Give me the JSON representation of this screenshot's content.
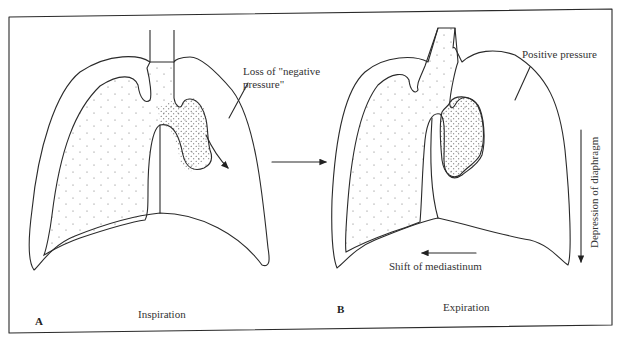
{
  "figure": {
    "panels": [
      {
        "letter": "A",
        "caption": "Inspiration",
        "annotation": "Loss of \"negative",
        "annotation_line2": "pressure\""
      },
      {
        "letter": "B",
        "caption": "Expiration",
        "annotation": "Positive pressure",
        "arrow_label_horizontal": "Shift of mediastinum",
        "arrow_label_vertical": "Depression of diaphragm"
      }
    ],
    "colors": {
      "line": "#2a2a2a",
      "stipple": "#555555",
      "background": "#ffffff"
    }
  }
}
